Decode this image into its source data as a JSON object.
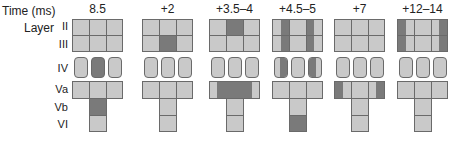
{
  "header": {
    "time_label": "Time (ms)",
    "layer_label": "Layer"
  },
  "layers": [
    "II",
    "III",
    "IV",
    "Va",
    "Vb",
    "VI"
  ],
  "panels": [
    {
      "time": "8.5"
    },
    {
      "time": "+2"
    },
    {
      "time": "+3.5–4"
    },
    {
      "time": "+4.5–5"
    },
    {
      "time": "+7"
    },
    {
      "time": "+12–14"
    }
  ],
  "colors": {
    "inactive": "#c9c9c9",
    "active": "#7a7a7a",
    "border": "#6a6a6a"
  }
}
